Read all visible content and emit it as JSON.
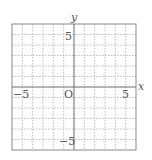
{
  "diagram": {
    "type": "coordinate-grid",
    "axes": {
      "x_label": "x",
      "y_label": "y",
      "origin_label": "O"
    },
    "range": {
      "xmin": -6,
      "xmax": 6,
      "ymin": -6,
      "ymax": 6
    },
    "tick_labels": {
      "x_neg": "−5",
      "x_pos": "5",
      "y_pos": "5",
      "y_neg": "−5"
    },
    "grid_step": 1,
    "colors": {
      "border": "#8a8a8a",
      "axis": "#7a7a7a",
      "grid": "#bdbdbd",
      "text": "#555555"
    }
  }
}
